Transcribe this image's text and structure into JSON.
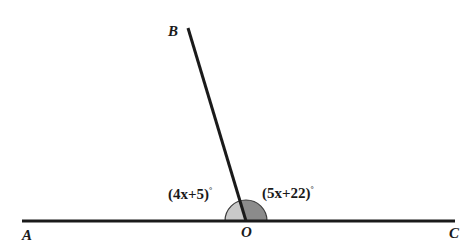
{
  "figure": {
    "type": "linear-pair-angle-diagram",
    "background_color": "#ffffff",
    "stroke_color": "#1a1a1a",
    "points": [
      {
        "id": "A",
        "label": "A",
        "x": 22,
        "y": 221,
        "role": "ray-endpoint-left"
      },
      {
        "id": "B",
        "label": "B",
        "x": 188,
        "y": 28,
        "role": "ray-endpoint-upper"
      },
      {
        "id": "C",
        "label": "C",
        "x": 455,
        "y": 221,
        "role": "ray-endpoint-right"
      },
      {
        "id": "O",
        "label": "O",
        "x": 246,
        "y": 221,
        "role": "vertex"
      }
    ],
    "segments": [
      {
        "id": "AC",
        "from": "A",
        "to": "C",
        "label": "straight-line-AC",
        "width": 3
      },
      {
        "id": "OB",
        "from": "O",
        "to": "B",
        "label": "ray-OB",
        "width": 3
      }
    ],
    "angles": [
      {
        "id": "AOB",
        "expression": "(4x+5)",
        "degree_symbol": "°",
        "vertex": "O",
        "between": [
          "A",
          "B"
        ],
        "fill_color": "#c9c9c9",
        "side": "left"
      },
      {
        "id": "BOC",
        "expression": "(5x+22)",
        "degree_symbol": "°",
        "vertex": "O",
        "between": [
          "B",
          "C"
        ],
        "fill_color": "#8b8b8b",
        "side": "right"
      }
    ],
    "angle_arc": {
      "center_x": 246,
      "center_y": 221,
      "radius": 21,
      "outline_color": "#3a3a3a"
    }
  }
}
